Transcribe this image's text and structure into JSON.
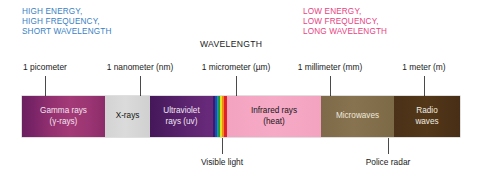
{
  "headings": {
    "high": "HIGH ENERGY,\nHIGH FREQUENCY,\nSHORT WAVELENGTH",
    "low": "LOW ENERGY,\nLOW FREQUENCY,\nLONG WAVELENGTH",
    "center": "WAVELENGTH"
  },
  "colors": {
    "high_energy_text": "#3a7fc4",
    "low_energy_text": "#e8437f",
    "center_text": "#1a1a1a",
    "tick": "#4a4a4a",
    "gamma": "#93306f",
    "xray": "#d2d3d2",
    "ultraviolet": "#5d2470",
    "infrared": "#f3a3c0",
    "microwaves": "#7e6a48",
    "radio": "#4a3118"
  },
  "scale": {
    "ticks": [
      {
        "label": "1 picometer",
        "x": 45
      },
      {
        "label": "1 nanometer (nm)",
        "x": 140
      },
      {
        "label": "1 micrometer (µm)",
        "x": 236
      },
      {
        "label": "1 millimeter (mm)",
        "x": 330
      },
      {
        "label": "1 meter (m)",
        "x": 424
      }
    ]
  },
  "chart_data": {
    "type": "bar",
    "xlabel": "WAVELENGTH",
    "ylabel": "",
    "orientation": "horizontal-strip",
    "categories": [
      "Gamma rays (γ-rays)",
      "X-rays",
      "Ultraviolet rays (uv)",
      "Visible light",
      "Infrared rays (heat)",
      "Microwaves",
      "Radio waves"
    ],
    "axis_ticks": [
      "1 picometer",
      "1 nanometer (nm)",
      "1 micrometer (µm)",
      "1 millimeter (mm)",
      "1 meter (m)"
    ],
    "annotations": [
      "Visible light",
      "Police radar"
    ],
    "legend": "none",
    "grid": false
  },
  "bands": [
    {
      "name": "gamma-rays",
      "line1": "Gamma rays",
      "line2": "(γ-rays)"
    },
    {
      "name": "x-rays",
      "line1": "X-rays",
      "line2": ""
    },
    {
      "name": "ultraviolet",
      "line1": "Ultraviolet",
      "line2": "rays (uv)"
    },
    {
      "name": "visible",
      "line1": "",
      "line2": ""
    },
    {
      "name": "infrared",
      "line1": "Infrared rays",
      "line2": "(heat)"
    },
    {
      "name": "microwaves",
      "line1": "Microwaves",
      "line2": ""
    },
    {
      "name": "radio-waves",
      "line1": "Radio",
      "line2": "waves"
    }
  ],
  "callouts": [
    {
      "label": "Visible light",
      "x": 222,
      "top": 138,
      "height": 16,
      "label_top": 157
    },
    {
      "label": "Police radar",
      "x": 388,
      "top": 138,
      "height": 16,
      "label_top": 157
    }
  ]
}
